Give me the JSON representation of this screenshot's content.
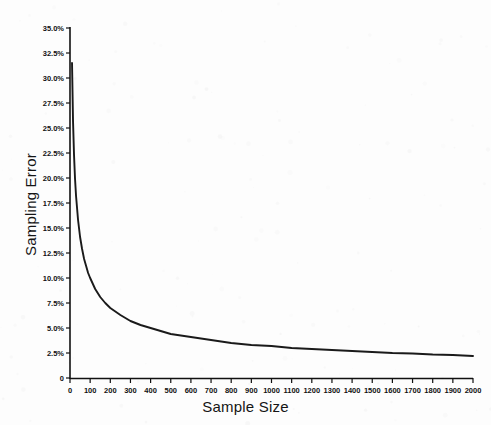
{
  "chart_data": {
    "type": "line",
    "title": "",
    "xlabel": "Sample Size",
    "ylabel": "Sampling Error",
    "xlim": [
      0,
      2000
    ],
    "ylim": [
      0,
      35
    ],
    "grid": false,
    "legend": null,
    "y_tick_labels": [
      "35.0%",
      "32.5%",
      "30.0%",
      "27.5%",
      "25.0%",
      "22.5%",
      "20.0%",
      "17.5%",
      "15.0%",
      "12.5%",
      "10.0%",
      "7.5%",
      "5.0%",
      "2.5%",
      "0"
    ],
    "y_tick_values": [
      35.0,
      32.5,
      30.0,
      27.5,
      25.0,
      22.5,
      20.0,
      17.5,
      15.0,
      12.5,
      10.0,
      7.5,
      5.0,
      2.5,
      0
    ],
    "x_tick_labels": [
      "0",
      "100",
      "200",
      "300",
      "400",
      "500",
      "600",
      "700",
      "800",
      "900",
      "1000",
      "1100",
      "1200",
      "1300",
      "1400",
      "1500",
      "1600",
      "1700",
      "1800",
      "1900",
      "2000"
    ],
    "x_tick_values": [
      0,
      100,
      200,
      300,
      400,
      500,
      600,
      700,
      800,
      900,
      1000,
      1100,
      1200,
      1300,
      1400,
      1500,
      1600,
      1700,
      1800,
      1900,
      2000
    ],
    "series": [
      {
        "name": "Sampling Error",
        "x": [
          10,
          15,
          20,
          25,
          30,
          40,
          50,
          60,
          70,
          80,
          90,
          100,
          125,
          150,
          175,
          200,
          250,
          300,
          350,
          400,
          450,
          500,
          600,
          700,
          800,
          900,
          1000,
          1100,
          1200,
          1300,
          1400,
          1500,
          1600,
          1700,
          1800,
          1900,
          2000
        ],
        "values": [
          31.5,
          25.7,
          22.3,
          19.9,
          18.2,
          15.8,
          14.1,
          12.9,
          11.9,
          11.2,
          10.5,
          10.0,
          8.9,
          8.1,
          7.5,
          7.0,
          6.3,
          5.7,
          5.3,
          5.0,
          4.7,
          4.4,
          4.1,
          3.8,
          3.5,
          3.3,
          3.2,
          3.0,
          2.9,
          2.8,
          2.7,
          2.6,
          2.5,
          2.45,
          2.35,
          2.3,
          2.2
        ]
      }
    ]
  },
  "axes": {
    "x_title": "Sample Size",
    "y_title": "Sampling Error"
  },
  "style": {
    "line_color": "#1a1a1a",
    "axis_color": "#111111",
    "background": "#fdfdfd"
  }
}
